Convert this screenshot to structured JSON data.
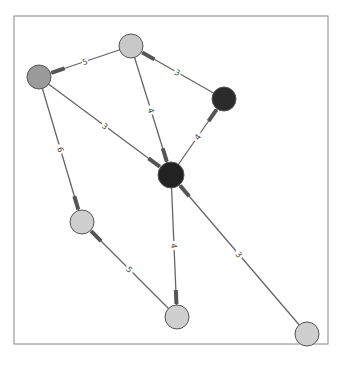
{
  "graph": {
    "frame": {
      "x": 14,
      "y": 16,
      "width": 314,
      "height": 328,
      "stroke": "#888888"
    },
    "nodes": [
      {
        "id": "A",
        "x": 39,
        "y": 77,
        "r": 12,
        "fill": "#9a9a9a"
      },
      {
        "id": "B",
        "x": 131,
        "y": 46,
        "r": 12,
        "fill": "#c8c8c8"
      },
      {
        "id": "C",
        "x": 224,
        "y": 99,
        "r": 12,
        "fill": "#2b2b2b"
      },
      {
        "id": "D",
        "x": 171,
        "y": 175,
        "r": 13,
        "fill": "#222222"
      },
      {
        "id": "E",
        "x": 82,
        "y": 222,
        "r": 12,
        "fill": "#cfcfcf"
      },
      {
        "id": "F",
        "x": 177,
        "y": 317,
        "r": 12,
        "fill": "#cfcfcf"
      },
      {
        "id": "G",
        "x": 307,
        "y": 334,
        "r": 12,
        "fill": "#cfcfcf"
      }
    ],
    "edges": [
      {
        "from": "B",
        "to": "A",
        "label": "5"
      },
      {
        "from": "C",
        "to": "B",
        "label": "3"
      },
      {
        "from": "B",
        "to": "D",
        "label": "4"
      },
      {
        "from": "A",
        "to": "D",
        "label": "3"
      },
      {
        "from": "D",
        "to": "C",
        "label": "4"
      },
      {
        "from": "A",
        "to": "E",
        "label": "6"
      },
      {
        "from": "F",
        "to": "E",
        "label": "5"
      },
      {
        "from": "D",
        "to": "F",
        "label": "4"
      },
      {
        "from": "G",
        "to": "D",
        "label": "3"
      }
    ],
    "colors": {
      "edge": "#666666",
      "arrow": "#555555",
      "node_stroke": "#555555"
    }
  }
}
